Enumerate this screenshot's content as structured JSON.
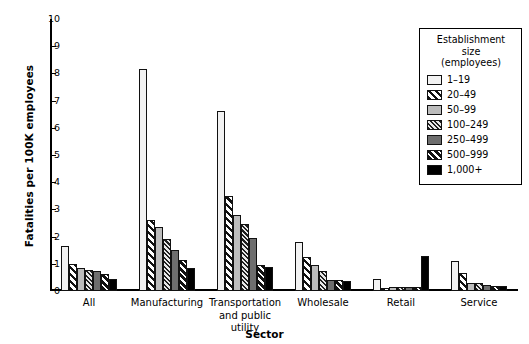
{
  "chart_data": {
    "type": "bar",
    "title": "",
    "xlabel": "Sector",
    "ylabel": "Fatalities per 100K employees",
    "ylim": [
      0,
      10
    ],
    "yticks": [
      0,
      1,
      2,
      3,
      4,
      5,
      6,
      7,
      8,
      9,
      10
    ],
    "grid": false,
    "legend_position": "top-right",
    "legend_title": "Establishment size (employees)",
    "categories": [
      "All",
      "Manufacturing",
      "Transportation and public utility",
      "Wholesale",
      "Retail",
      "Service"
    ],
    "series": [
      {
        "name": "1–19",
        "values": [
          1.65,
          8.15,
          6.62,
          1.8,
          0.45,
          1.1
        ]
      },
      {
        "name": "20–49",
        "values": [
          0.98,
          2.6,
          3.5,
          1.25,
          0.12,
          0.65
        ]
      },
      {
        "name": "50–99",
        "values": [
          0.85,
          2.35,
          2.8,
          0.95,
          0.13,
          0.3
        ]
      },
      {
        "name": "100–249",
        "values": [
          0.78,
          1.9,
          2.45,
          0.72,
          0.13,
          0.28
        ]
      },
      {
        "name": "250–499",
        "values": [
          0.72,
          1.5,
          1.95,
          0.4,
          0.13,
          0.22
        ]
      },
      {
        "name": "500–999",
        "values": [
          0.62,
          1.15,
          0.95,
          0.42,
          0.14,
          0.2
        ]
      },
      {
        "name": "1,000+",
        "values": [
          0.45,
          0.85,
          0.88,
          0.35,
          1.3,
          0.18
        ]
      }
    ]
  },
  "legend": {
    "title_line1": "Establishment",
    "title_line2": "size",
    "title_line3": "(employees)",
    "items": [
      {
        "label": "1–19"
      },
      {
        "label": "20–49"
      },
      {
        "label": "50–99"
      },
      {
        "label": "100–249"
      },
      {
        "label": "250–499"
      },
      {
        "label": "500–999"
      },
      {
        "label": "1,000+"
      }
    ]
  },
  "axes": {
    "y_title": "Fatalities per 100K employees",
    "x_title": "Sector",
    "y_ticks": [
      "10",
      "9",
      "8",
      "7",
      "6",
      "5",
      "4",
      "3",
      "2",
      "1",
      "0"
    ],
    "x_tick_labels": [
      [
        "All"
      ],
      [
        "Manufacturing"
      ],
      [
        "Transportation",
        "and public",
        "utility"
      ],
      [
        "Wholesale"
      ],
      [
        "Retail"
      ],
      [
        "Service"
      ]
    ]
  }
}
